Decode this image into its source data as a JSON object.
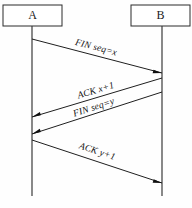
{
  "diagram": {
    "type": "sequence-diagram",
    "background_color": "#fefefe",
    "line_color": "#1f1f1f",
    "text_color": "#111111",
    "participants": [
      {
        "id": "A",
        "label": "A",
        "box_x": 3,
        "box_y": 5,
        "box_w": 59,
        "box_h": 21,
        "lifeline_x": 32,
        "lifeline_y1": 26,
        "lifeline_y2": 196
      },
      {
        "id": "B",
        "label": "B",
        "box_x": 131,
        "box_y": 5,
        "box_w": 59,
        "box_h": 21,
        "lifeline_x": 162,
        "lifeline_y1": 26,
        "lifeline_y2": 196
      }
    ],
    "messages": [
      {
        "label": "FIN seq=x",
        "from": "A",
        "to": "B",
        "x1": 32,
        "y1": 39,
        "x2": 162,
        "y2": 73,
        "label_x": 96,
        "label_y": 48,
        "label_rotate": 14.7
      },
      {
        "label": "ACK x+1",
        "from": "B",
        "to": "A",
        "x1": 162,
        "y1": 78,
        "x2": 32,
        "y2": 117,
        "label_x": 96,
        "label_y": 91,
        "label_rotate": -16.8
      },
      {
        "label": "FIN seq=y",
        "from": "B",
        "to": "A",
        "x1": 162,
        "y1": 92,
        "x2": 32,
        "y2": 134,
        "label_x": 94,
        "label_y": 108,
        "label_rotate": -17.9
      },
      {
        "label": "ACK y+1",
        "from": "A",
        "to": "B",
        "x1": 32,
        "y1": 140,
        "x2": 162,
        "y2": 183,
        "label_x": 97,
        "label_y": 152,
        "label_rotate": 18.4
      }
    ]
  }
}
